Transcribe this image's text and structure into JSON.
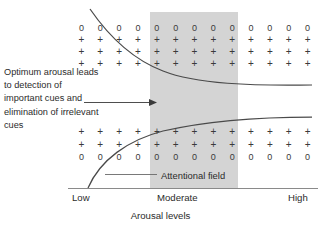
{
  "figure": {
    "annotation_text": "Optimum arousal leads to detection of important cues and elimination of irrelevant cues",
    "attentional_field_label": "Attentional field",
    "axis_title": "Arousal levels",
    "axis_ticks": {
      "low": "Low",
      "moderate": "Moderate",
      "high": "High"
    },
    "colors": {
      "band_fill": "#d4d4d4",
      "curve": "#4a4a4a",
      "axis": "#8a8a8a",
      "text": "#2b2b2b",
      "symbol": "#3a3a3a",
      "background": "#ffffff"
    }
  },
  "chart_data": {
    "type": "area",
    "xlabel": "Arousal levels",
    "ylabel": "",
    "grid": false,
    "legend": "none",
    "xlim": [
      0,
      100
    ],
    "ylim": [
      0,
      100
    ],
    "categories": [
      "Low",
      "Moderate",
      "High"
    ],
    "highlight_band": {
      "label": "Moderate",
      "x_start": 33,
      "x_end": 68
    },
    "series": [
      {
        "name": "upper attentional boundary",
        "x": [
          9,
          20,
          33,
          45,
          55,
          68,
          80,
          92,
          100
        ],
        "values": [
          96,
          83,
          72,
          64,
          59,
          56,
          54,
          53,
          53
        ]
      },
      {
        "name": "lower attentional boundary",
        "x": [
          9,
          20,
          33,
          45,
          55,
          68,
          80,
          92,
          100
        ],
        "values": [
          0,
          16,
          27,
          34,
          39,
          42,
          44,
          46,
          47
        ]
      }
    ],
    "symbol_field": {
      "columns": 13,
      "top_rows": [
        [
          "0",
          "0",
          "0",
          "0",
          "0",
          "0",
          "0",
          "0",
          "0",
          "0",
          "0",
          "0",
          "0"
        ],
        [
          "+",
          "+",
          "+",
          "+",
          "+",
          "+",
          "+",
          "+",
          "+",
          "+",
          "+",
          "+",
          "+"
        ],
        [
          "+",
          "+",
          "+",
          "+",
          "+",
          "+",
          "+",
          "+",
          "+",
          "+",
          "+",
          "+",
          "+"
        ],
        [
          "+",
          "+",
          "+",
          "+",
          "+",
          "+",
          "+",
          "+",
          "+",
          "+",
          "+",
          "+",
          "+"
        ]
      ],
      "bottom_rows": [
        [
          "+",
          "+",
          "+",
          "+",
          "+",
          "+",
          "+",
          "+",
          "+",
          "+",
          "+",
          "+",
          "+"
        ],
        [
          "+",
          "+",
          "+",
          "+",
          "+",
          "+",
          "+",
          "+",
          "+",
          "+",
          "+",
          "+",
          "+"
        ],
        [
          "0",
          "0",
          "0",
          "0",
          "0",
          "0",
          "0",
          "0",
          "0",
          "0",
          "0",
          "0",
          "0"
        ]
      ]
    },
    "annotations": [
      {
        "text": "Optimum arousal leads to detection of important cues and elimination of irrelevant cues",
        "arrow_to_x": 36,
        "arrow_to_y": 50
      },
      {
        "text": "Attentional field",
        "leader_from_x": 33,
        "leader_to_x": 13
      }
    ]
  }
}
